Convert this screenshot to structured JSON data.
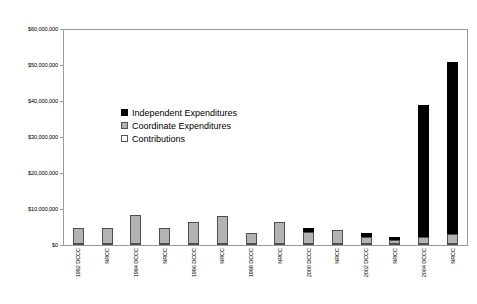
{
  "chart_data": {
    "type": "bar",
    "title": "",
    "subtitle": "",
    "xlabel": "",
    "ylabel": "",
    "stacked": true,
    "orientation": "vertical",
    "grid": false,
    "legend_position": "inside-upper-left",
    "ylim": [
      0,
      60000000
    ],
    "ytick_values": [
      0,
      10000000,
      20000000,
      30000000,
      40000000,
      50000000,
      60000000
    ],
    "ytick_labels": [
      "$0",
      "$10,000,000",
      "$20,000,000",
      "$30,000,000",
      "$40,000,000",
      "$50,000,000",
      "$60,000,000"
    ],
    "categories": [
      "1992 DCCC",
      "NRCC",
      "1994 DCCC",
      "NRCC",
      "1996 DCCC",
      "NRCC",
      "1998 DCCC",
      "NRCC",
      "2000 DCCC",
      "NRCC",
      "2002 DCCC",
      "NRCC",
      "2004 DCCC",
      "NRCC"
    ],
    "category_years": [
      "1992",
      "",
      "1994",
      "",
      "1996",
      "",
      "1998",
      "",
      "2000",
      "",
      "2002",
      "",
      "2004",
      ""
    ],
    "category_committees": [
      "DCCC",
      "NRCC",
      "DCCC",
      "NRCC",
      "DCCC",
      "NRCC",
      "DCCC",
      "NRCC",
      "DCCC",
      "NRCC",
      "DCCC",
      "NRCC",
      "DCCC",
      "NRCC"
    ],
    "series": [
      {
        "name": "Contributions",
        "color": "#ffffff",
        "values": [
          400000,
          400000,
          400000,
          400000,
          400000,
          400000,
          350000,
          400000,
          500000,
          500000,
          400000,
          400000,
          500000,
          500000
        ]
      },
      {
        "name": "Coordinate Expenditures",
        "color": "#b3b3b3",
        "values": [
          4100000,
          4100000,
          7900000,
          4100000,
          5800000,
          7400000,
          2850000,
          5800000,
          3000000,
          3700000,
          1800000,
          900000,
          1700000,
          2600000
        ]
      },
      {
        "name": "Independent Expenditures",
        "color": "#000000",
        "values": [
          0,
          0,
          0,
          0,
          0,
          0,
          0,
          0,
          1100000,
          0,
          1100000,
          700000,
          36800000,
          47900000
        ]
      }
    ],
    "totals": [
      4500000,
      4500000,
      8300000,
      4500000,
      6200000,
      7800000,
      3200000,
      6200000,
      4600000,
      4200000,
      3300000,
      2000000,
      39000000,
      51000000
    ]
  },
  "legend": {
    "items": [
      {
        "label": "Independent Expenditures",
        "swatch": "black-square-icon"
      },
      {
        "label": "Coordinate Expenditures",
        "swatch": "gray-square-icon"
      },
      {
        "label": "Contributions",
        "swatch": "white-square-icon"
      }
    ]
  }
}
